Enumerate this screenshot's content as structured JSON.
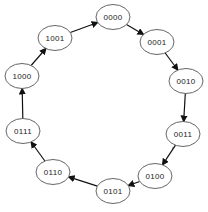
{
  "diagram": {
    "type": "state-cycle",
    "node_style": {
      "rx": 17,
      "ry": 12.5,
      "stroke": "#555555",
      "fill": "#ffffff"
    },
    "arrow_color": "#111111",
    "nodes": [
      {
        "id": "n0",
        "label": "0000",
        "cx": 113,
        "cy": 17
      },
      {
        "id": "n1",
        "label": "0001",
        "cx": 157,
        "cy": 42
      },
      {
        "id": "n2",
        "label": "0010",
        "cx": 186,
        "cy": 81
      },
      {
        "id": "n3",
        "label": "0011",
        "cx": 183,
        "cy": 134
      },
      {
        "id": "n4",
        "label": "0100",
        "cx": 155,
        "cy": 176
      },
      {
        "id": "n5",
        "label": "0101",
        "cx": 113,
        "cy": 191
      },
      {
        "id": "n6",
        "label": "0110",
        "cx": 53,
        "cy": 172
      },
      {
        "id": "n7",
        "label": "0111",
        "cx": 23,
        "cy": 131
      },
      {
        "id": "n8",
        "label": "1000",
        "cx": 22,
        "cy": 76
      },
      {
        "id": "n9",
        "label": "1001",
        "cx": 55,
        "cy": 38
      }
    ],
    "edges": [
      {
        "from": "0000",
        "to": "0001"
      },
      {
        "from": "0001",
        "to": "0010"
      },
      {
        "from": "0010",
        "to": "0011"
      },
      {
        "from": "0011",
        "to": "0100"
      },
      {
        "from": "0100",
        "to": "0101"
      },
      {
        "from": "0101",
        "to": "0110"
      },
      {
        "from": "0110",
        "to": "0111"
      },
      {
        "from": "0111",
        "to": "1000"
      },
      {
        "from": "1000",
        "to": "1001"
      },
      {
        "from": "1001",
        "to": "0000"
      }
    ]
  }
}
